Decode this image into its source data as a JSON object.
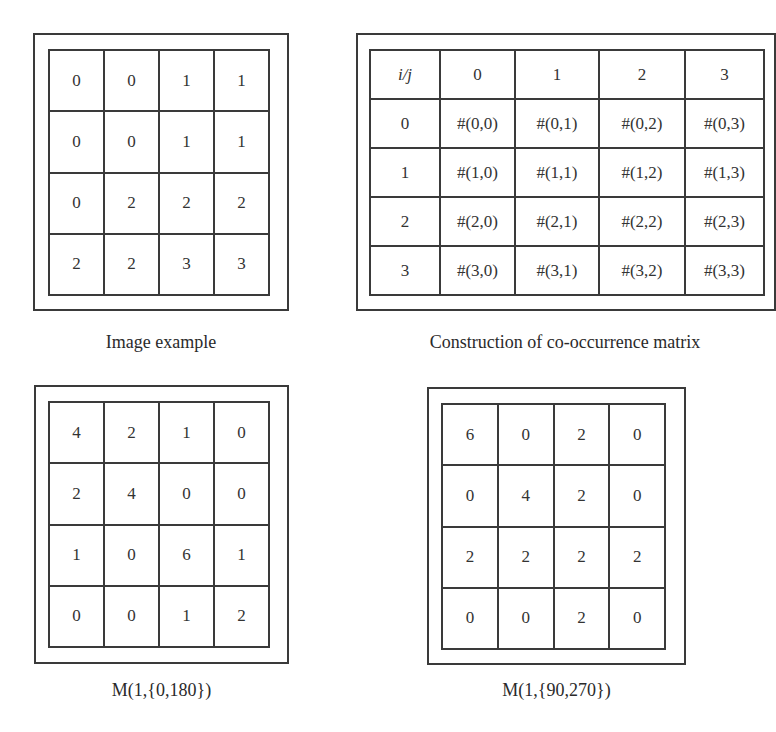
{
  "panels": {
    "image_example": {
      "caption": "Image example",
      "rows": [
        [
          "0",
          "0",
          "1",
          "1"
        ],
        [
          "0",
          "0",
          "1",
          "1"
        ],
        [
          "0",
          "2",
          "2",
          "2"
        ],
        [
          "2",
          "2",
          "3",
          "3"
        ]
      ]
    },
    "construction": {
      "caption": "Construction of co-occurrence matrix",
      "corner_label": "i/j",
      "col_headers": [
        "0",
        "1",
        "2",
        "3"
      ],
      "row_headers": [
        "0",
        "1",
        "2",
        "3"
      ],
      "rows": [
        [
          "#(0,0)",
          "#(0,1)",
          "#(0,2)",
          "#(0,3)"
        ],
        [
          "#(1,0)",
          "#(1,1)",
          "#(1,2)",
          "#(1,3)"
        ],
        [
          "#(2,0)",
          "#(2,1)",
          "#(2,2)",
          "#(2,3)"
        ],
        [
          "#(3,0)",
          "#(3,1)",
          "#(3,2)",
          "#(3,3)"
        ]
      ]
    },
    "m_0_180": {
      "caption": "M(1,{0,180})",
      "rows": [
        [
          "4",
          "2",
          "1",
          "0"
        ],
        [
          "2",
          "4",
          "0",
          "0"
        ],
        [
          "1",
          "0",
          "6",
          "1"
        ],
        [
          "0",
          "0",
          "1",
          "2"
        ]
      ]
    },
    "m_90_270": {
      "caption": "M(1,{90,270})",
      "rows": [
        [
          "6",
          "0",
          "2",
          "0"
        ],
        [
          "0",
          "4",
          "2",
          "0"
        ],
        [
          "2",
          "2",
          "2",
          "2"
        ],
        [
          "0",
          "0",
          "2",
          "0"
        ]
      ]
    }
  },
  "colors": {
    "line": "#3a3a3a",
    "text": "#2a2a2a",
    "background": "#ffffff"
  }
}
